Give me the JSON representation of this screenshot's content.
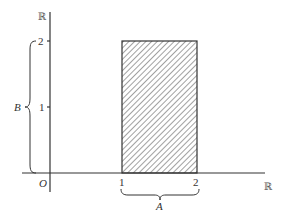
{
  "diagram": {
    "type": "product-set-rectangle",
    "x_axis": {
      "label": "ℝ",
      "ticks": [
        "1",
        "2"
      ]
    },
    "y_axis": {
      "label": "ℝ",
      "ticks": [
        "1",
        "2"
      ]
    },
    "origin_label": "O",
    "region": {
      "x_range": [
        1,
        2
      ],
      "y_range": [
        0,
        2
      ],
      "fill": "diagonal-hatch"
    },
    "brace_x_label": "A",
    "brace_y_label": "B",
    "colors": {
      "ink": "#333333",
      "background": "#ffffff"
    }
  }
}
